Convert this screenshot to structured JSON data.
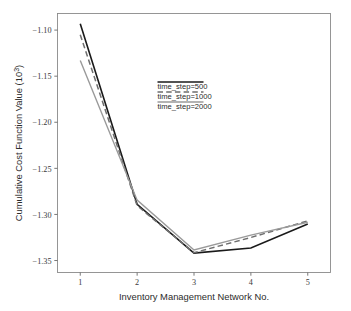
{
  "chart_data": {
    "type": "line",
    "title": "",
    "xlabel": "Inventory Management Network No.",
    "ylabel": "Cumulative Cost Function Value (10",
    "ylabel_superscript": "3",
    "ylabel_suffix": ")",
    "x": [
      1,
      2,
      3,
      4,
      5
    ],
    "xticklabels": [
      "1",
      "2",
      "3",
      "4",
      "5"
    ],
    "yticklabels": [
      "−1.10",
      "−1.15",
      "−1.20",
      "−1.25",
      "−1.30",
      "−1.35"
    ],
    "yticks": [
      -1.1,
      -1.15,
      -1.2,
      -1.25,
      -1.3,
      -1.35
    ],
    "xlim": [
      0.6,
      5.4
    ],
    "ylim": [
      -1.363,
      -1.082
    ],
    "grid": false,
    "legend_position": "center",
    "series": [
      {
        "name": "time_step=500",
        "style": "solid",
        "color": "#1a1a1a",
        "width": 1.6,
        "values": [
          -1.093,
          -1.289,
          -1.342,
          -1.3365,
          -1.3105
        ]
      },
      {
        "name": "time_step=1000",
        "style": "dashed",
        "color": "#6e6e6e",
        "width": 1.5,
        "values": [
          -1.105,
          -1.2905,
          -1.3415,
          -1.325,
          -1.307
        ]
      },
      {
        "name": "time_step=2000",
        "style": "solid",
        "color": "#9a9a9a",
        "width": 1.4,
        "values": [
          -1.133,
          -1.2845,
          -1.3385,
          -1.3225,
          -1.3085
        ]
      }
    ]
  },
  "legend": {
    "entries": [
      {
        "label": "time_step=500"
      },
      {
        "label": "time_step=1000"
      },
      {
        "label": "time_step=2000"
      }
    ]
  }
}
